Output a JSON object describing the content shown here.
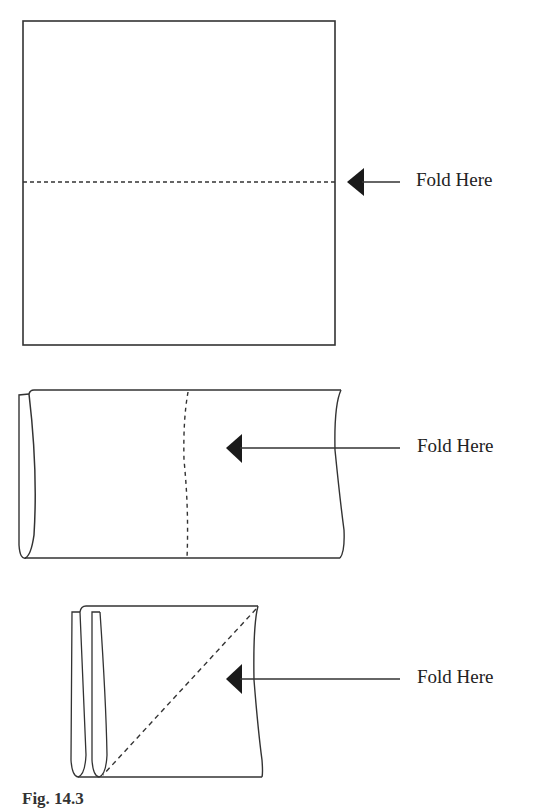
{
  "diagram": {
    "steps": [
      {
        "id": "step-1",
        "shape": "square sheet",
        "fold_line": "horizontal dashed",
        "label": "Fold Here"
      },
      {
        "id": "step-2",
        "shape": "folded rectangle",
        "fold_line": "vertical dashed",
        "label": "Fold Here"
      },
      {
        "id": "step-3",
        "shape": "folded square",
        "fold_line": "diagonal dashed",
        "label": "Fold Here"
      }
    ],
    "caption": "Fig. 14.3"
  },
  "colors": {
    "stroke": "#333333",
    "arrow": "#1a1a1a",
    "background": "#ffffff"
  }
}
